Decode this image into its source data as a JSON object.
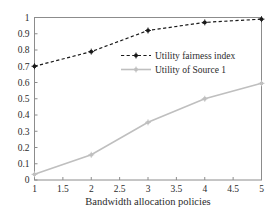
{
  "chart_data": {
    "type": "line",
    "title": "",
    "subtitle": "",
    "xlabel": "Bandwidth allocation policies",
    "ylabel": "",
    "x": [
      1,
      2,
      3,
      4,
      5
    ],
    "xlim": [
      1,
      5
    ],
    "ylim": [
      0,
      1
    ],
    "xticks": [
      1,
      1.5,
      2,
      2.5,
      3,
      3.5,
      4,
      4.5,
      5
    ],
    "xticklabels": [
      "1",
      "1.5",
      "2",
      "2.5",
      "3",
      "3.5",
      "4",
      "4.5",
      "5"
    ],
    "yticks": [
      0,
      0.1,
      0.2,
      0.3,
      0.4,
      0.5,
      0.6,
      0.7,
      0.8,
      0.9,
      1
    ],
    "yticklabels": [
      "0",
      "0.1",
      "0.2",
      "0.3",
      "0.4",
      "0.5",
      "0.6",
      "0.7",
      "0.8",
      "0.9",
      "1"
    ],
    "grid": false,
    "legend_position": "center",
    "series": [
      {
        "name": "Utility fairness index",
        "values": [
          0.7,
          0.79,
          0.92,
          0.97,
          0.99
        ],
        "color": "#1a1a1a",
        "linestyle": "dashed",
        "marker": "star"
      },
      {
        "name": "Utility of Source 1",
        "values": [
          0.035,
          0.155,
          0.355,
          0.5,
          0.595
        ],
        "color": "#bfbfbf",
        "linestyle": "solid",
        "marker": "star"
      }
    ]
  },
  "axes": {
    "frame_color": "#8c8c8c",
    "background": "#ffffff"
  },
  "legend": {
    "entries": [
      {
        "label": "Utility fairness index"
      },
      {
        "label": "Utility of Source 1"
      }
    ]
  }
}
